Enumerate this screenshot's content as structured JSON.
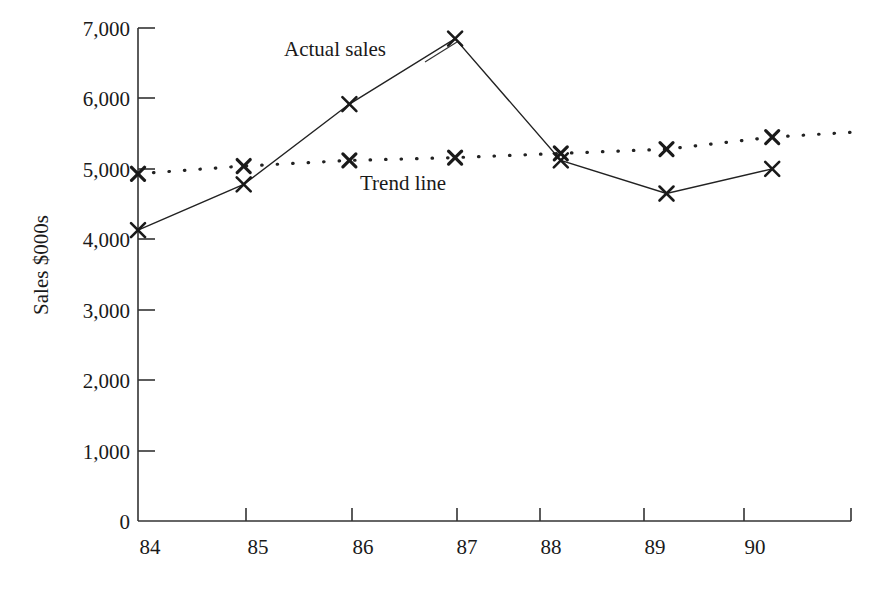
{
  "chart_data": {
    "type": "line",
    "title": "",
    "xlabel": "",
    "ylabel": "Sales $000s",
    "x": [
      "84",
      "85",
      "86",
      "87",
      "88",
      "89",
      "90"
    ],
    "categories": [
      "84",
      "85",
      "86",
      "87",
      "88",
      "89",
      "90"
    ],
    "ylim": [
      0,
      7000
    ],
    "xlim": [
      "84",
      "91"
    ],
    "ytick_labels": [
      "7,000",
      "6,000",
      "5,000",
      "4,000",
      "3,000",
      "2,000",
      "1,000",
      "0"
    ],
    "ytick_values": [
      7000,
      6000,
      5000,
      4000,
      3000,
      2000,
      1000,
      0
    ],
    "xtick_labels": [
      "84",
      "85",
      "86",
      "87",
      "88",
      "89",
      "90"
    ],
    "grid": false,
    "legend_position": "inline-annotations",
    "marker": "x",
    "series": [
      {
        "name": "Actual sales",
        "style": "solid",
        "color": "#222222",
        "values": [
          4130,
          4780,
          5920,
          6850,
          5120,
          4650,
          5000
        ]
      },
      {
        "name": "Trend line",
        "style": "dotted",
        "color": "#222222",
        "values": [
          4930,
          5040,
          5120,
          5160,
          5220,
          5280,
          5450
        ],
        "extends_beyond_last_category_to": 5520
      }
    ],
    "annotations": [
      {
        "name": "actual-sales-label",
        "text": "Actual sales",
        "x": 84.9,
        "y": 6620
      },
      {
        "name": "trend-line-label",
        "text": "Trend line",
        "x": 86.1,
        "y": 4760
      }
    ]
  },
  "axes": {
    "y_axis_title": "Sales $000s",
    "axis_color": "#333333"
  }
}
